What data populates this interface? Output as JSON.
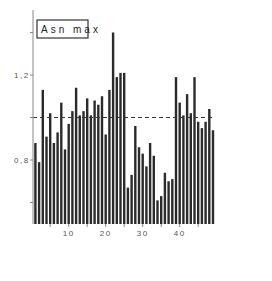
{
  "chart_data": {
    "type": "bar",
    "title": "",
    "legend": [
      "Asn max"
    ],
    "xlabel": "",
    "ylabel": "",
    "x": [
      1,
      2,
      3,
      4,
      5,
      6,
      7,
      8,
      9,
      10,
      11,
      12,
      13,
      14,
      15,
      16,
      17,
      18,
      19,
      20,
      21,
      22,
      23,
      24,
      25,
      26,
      27,
      28,
      29,
      30,
      31,
      32,
      33,
      34,
      35,
      36,
      37,
      38,
      39,
      40,
      41,
      42,
      43,
      44,
      45,
      46,
      47,
      48,
      49
    ],
    "values": [
      0.88,
      0.79,
      1.13,
      0.91,
      1.02,
      0.88,
      0.93,
      1.07,
      0.85,
      0.97,
      1.03,
      1.14,
      1.01,
      1.03,
      1.09,
      1.01,
      1.08,
      1.06,
      1.1,
      0.92,
      1.13,
      1.4,
      1.19,
      1.21,
      1.21,
      0.67,
      0.73,
      0.96,
      0.86,
      0.83,
      0.77,
      0.88,
      0.82,
      0.61,
      0.63,
      0.74,
      0.7,
      0.71,
      1.19,
      1.07,
      1.01,
      1.11,
      1.02,
      1.19,
      0.98,
      0.95,
      0.98,
      1.04,
      0.94
    ],
    "reference_line": {
      "y": 1.0,
      "style": "dashed"
    },
    "ylim": [
      0.5,
      1.5
    ],
    "yticks": [
      0.6,
      0.8,
      1.0,
      1.2,
      1.4
    ],
    "ytick_labels": [
      "",
      "0,8",
      "",
      "1,2",
      ""
    ],
    "xticks": [
      10,
      20,
      30,
      40
    ],
    "xtick_labels": [
      "10",
      "20",
      "30",
      "40"
    ],
    "grid": false,
    "legend_position": "upper-left"
  },
  "colors": {
    "bar": "#2b2b2b",
    "axis": "#888888",
    "reference_line": "#333333"
  }
}
